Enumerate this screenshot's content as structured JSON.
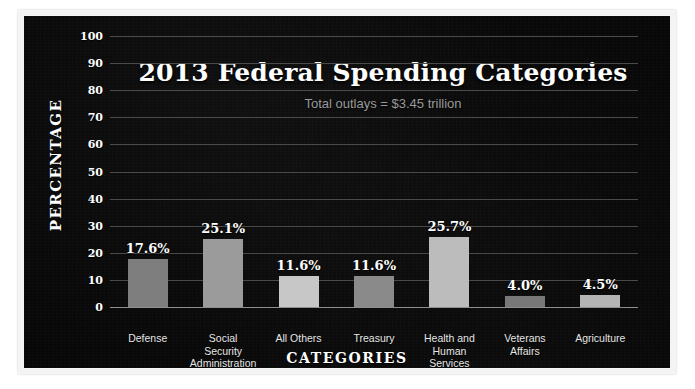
{
  "chart_data": {
    "type": "bar",
    "title": "2013 Federal Spending Categories",
    "subtitle": "Total outlays = $3.45 trillion",
    "xlabel": "CATEGORIES",
    "ylabel": "PERCENTAGE",
    "ylim": [
      0,
      100
    ],
    "ytick_step": 10,
    "ytick_labels": [
      "100",
      "90",
      "80",
      "70",
      "60",
      "50",
      "40",
      "30",
      "20",
      "10",
      "0"
    ],
    "grid": true,
    "legend": "none",
    "categories": [
      "Defense",
      "Social\nSecurity\nAdministration",
      "All Others",
      "Treasury",
      "Health and\nHuman\nServices",
      "Veterans\nAffairs",
      "Agriculture"
    ],
    "values": [
      17.6,
      25.1,
      11.6,
      11.6,
      25.7,
      4.0,
      4.5
    ],
    "data_labels": [
      "17.6%",
      "25.1%",
      "11.6%",
      "11.6%",
      "25.7%",
      "4.0%",
      "4.5%"
    ],
    "bar_colors": [
      "#7e7e7e",
      "#9b9b9b",
      "#c7c7c7",
      "#8a8a8a",
      "#bcbcbc",
      "#787878",
      "#b4b4b4"
    ]
  },
  "theme": {
    "background": "#070707",
    "page_background": "#ffffff",
    "gridline_color": "#4a4a4a",
    "axis_color": "#8f8f8f",
    "text_color": "#ffffff",
    "subtitle_color": "#9a9a9a",
    "category_label_color": "#e6e6e6"
  }
}
